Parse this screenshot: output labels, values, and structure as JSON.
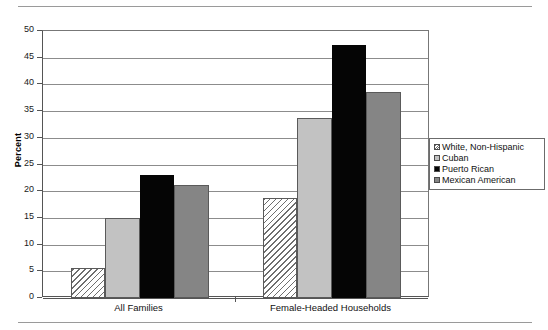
{
  "chart_data": {
    "type": "bar",
    "title": "",
    "xlabel": "",
    "ylabel": "Percent",
    "ylim": [
      0,
      50
    ],
    "yticks": [
      0,
      5,
      10,
      15,
      20,
      25,
      30,
      35,
      40,
      45,
      50
    ],
    "ytick_labels": [
      "0",
      "5",
      "10",
      "15",
      "20",
      "25",
      "30",
      "35",
      "40",
      "45",
      "50"
    ],
    "grid": true,
    "legend_position": "right",
    "categories": [
      "All Families",
      "Female-Headed Households"
    ],
    "series": [
      {
        "name": "White, Non-Hispanic",
        "fill": "fill-hatch",
        "color": "#ffffff",
        "values": [
          5.6,
          18.8
        ]
      },
      {
        "name": "Cuban",
        "fill": "fill-lightgray",
        "color": "#c2c2c2",
        "values": [
          15.0,
          33.8
        ]
      },
      {
        "name": "Puerto Rican",
        "fill": "fill-black",
        "color": "#050505",
        "values": [
          23.0,
          47.3
        ]
      },
      {
        "name": "Mexican American",
        "fill": "fill-midgray",
        "color": "#858585",
        "values": [
          21.2,
          38.5
        ]
      }
    ]
  },
  "legend": {
    "entries": [
      "White, Non-Hispanic",
      "Cuban",
      "Puerto Rican",
      "Mexican American"
    ]
  }
}
